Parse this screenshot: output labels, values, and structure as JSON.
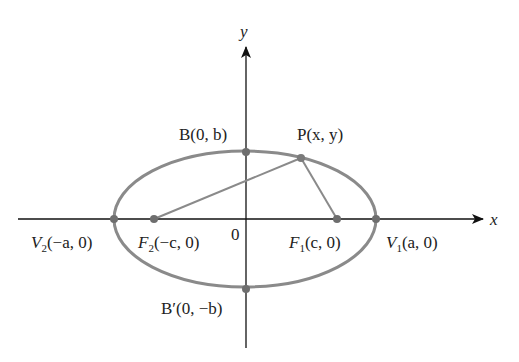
{
  "diagram": {
    "type": "ellipse-with-foci",
    "axes": {
      "x_label": "x",
      "y_label": "y",
      "origin_label": "0"
    },
    "ellipse": {
      "cx": 245,
      "cy": 219,
      "rx": 131,
      "ry": 68,
      "stroke": "#8a8a8a"
    },
    "points": [
      {
        "id": "V1",
        "name": "V",
        "sub": "1",
        "coords": "(a, 0)",
        "x": 376,
        "y": 219
      },
      {
        "id": "V2",
        "name": "V",
        "sub": "2",
        "coords": "(−a, 0)",
        "x": 114,
        "y": 219
      },
      {
        "id": "F1",
        "name": "F",
        "sub": "1",
        "coords": "(c, 0)",
        "x": 337,
        "y": 219
      },
      {
        "id": "F2",
        "name": "F",
        "sub": "2",
        "coords": "(−c, 0)",
        "x": 154,
        "y": 219
      },
      {
        "id": "B",
        "name": "B",
        "coords": "(0, b)",
        "x": 246,
        "y": 152
      },
      {
        "id": "Bp",
        "name": "B′",
        "coords": "(0, −b)",
        "x": 246,
        "y": 289
      },
      {
        "id": "P",
        "name": "P",
        "coords": "(x, y)",
        "x": 301,
        "y": 158
      }
    ],
    "labels": {
      "V1": {
        "name": "V",
        "sub": "1",
        "rest": "(a, 0)"
      },
      "V2": {
        "name": "V",
        "sub": "2",
        "rest": "(−a, 0)"
      },
      "F1": {
        "name": "F",
        "sub": "1",
        "rest": "(c, 0)"
      },
      "F2": {
        "name": "F",
        "sub": "2",
        "rest": "(−c, 0)"
      },
      "B": "B(0, b)",
      "Bp": "B′(0, −b)",
      "P": "P(x, y)"
    },
    "segments": [
      [
        "P",
        "F1"
      ],
      [
        "P",
        "F2"
      ]
    ],
    "colors": {
      "axis": "#111111",
      "curve": "#8a8a8a",
      "point": "#6e6e6e"
    }
  }
}
